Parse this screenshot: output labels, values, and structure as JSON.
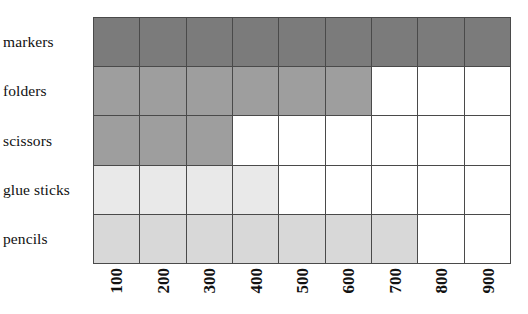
{
  "chart_data": {
    "type": "bar",
    "orientation": "horizontal",
    "title": "",
    "xlabel": "",
    "ylabel": "",
    "categories": [
      "markers",
      "folders",
      "scissors",
      "glue sticks",
      "pencils"
    ],
    "values": [
      900,
      600,
      300,
      400,
      700
    ],
    "series": [
      {
        "name": "",
        "values": [
          900,
          600,
          300,
          400,
          700
        ]
      }
    ],
    "x_tick_labels": [
      "100",
      "200",
      "300",
      "400",
      "500",
      "600",
      "700",
      "800",
      "900"
    ],
    "x_tick_values": [
      100,
      200,
      300,
      400,
      500,
      600,
      700,
      800,
      900
    ],
    "xlim": [
      0,
      900
    ],
    "grid": true,
    "legend": "none",
    "cells_per_row": [
      9,
      6,
      3,
      4,
      7
    ],
    "columns": 9,
    "rows": [
      {
        "label": "markers",
        "value": 900,
        "filled_cells": 9,
        "fill_color": "#7b7b7b"
      },
      {
        "label": "folders",
        "value": 600,
        "filled_cells": 6,
        "fill_color": "#9e9e9e"
      },
      {
        "label": "scissors",
        "value": 300,
        "filled_cells": 3,
        "fill_color": "#9e9e9e"
      },
      {
        "label": "glue sticks",
        "value": 400,
        "filled_cells": 4,
        "fill_color": "#e9e9e9"
      },
      {
        "label": "pencils",
        "value": 700,
        "filled_cells": 7,
        "fill_color": "#d8d8d8"
      }
    ]
  },
  "colors": {
    "background": "#ffffff",
    "grid_line": "#4a4a4a",
    "empty_cell": "#ffffff",
    "text": "#111111",
    "markers_fill": "#7b7b7b",
    "folders_fill": "#9e9e9e",
    "scissors_fill": "#9e9e9e",
    "glue_sticks_fill": "#e9e9e9",
    "pencils_fill": "#d8d8d8"
  }
}
